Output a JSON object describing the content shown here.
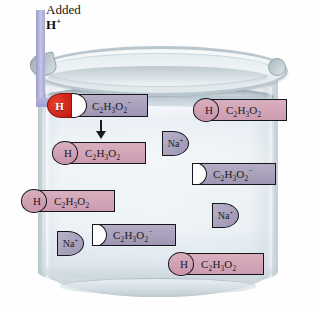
{
  "figure": {
    "feed_label_line1": "Added",
    "feed_label_line2_element": "H",
    "feed_label_line2_charge": "+",
    "arrow_feed_name": "added-h-arrow",
    "arrow_reaction_name": "reaction-down-arrow"
  },
  "colors": {
    "proton_red": "#c01712",
    "acetate_purple": "#a096b4",
    "acid_pink": "#cc9cb0",
    "sodium_purple": "#9d94b2",
    "feed_arrow_purple": "#9fa0cd",
    "glass_gray": "#b9c6cd",
    "liquid_blue": "#dde7ef",
    "outline_black": "#15161c"
  },
  "species": [
    {
      "id": "reacting-pair",
      "kind": "reacting-pair",
      "proton_label": "H",
      "formula_main": "C",
      "formula_html": "C2H3O2",
      "charge": "−",
      "x": 62,
      "y": 94,
      "width": 86,
      "description": "proton docking into acetate anion"
    },
    {
      "id": "product-acetic-acid",
      "kind": "acid",
      "h_label": "H",
      "formula_html": "C2H3O2",
      "charge": "",
      "x": 62,
      "y": 142,
      "width": 84
    },
    {
      "id": "acid-right-top",
      "kind": "acid",
      "h_label": "H",
      "formula_html": "C2H3O2",
      "charge": "",
      "x": 203,
      "y": 99,
      "width": 84
    },
    {
      "id": "acetate-right-mid",
      "kind": "acetate",
      "formula_html": "C2H3O2",
      "charge": "−",
      "x": 192,
      "y": 163,
      "width": 84
    },
    {
      "id": "acid-left-mid",
      "kind": "acid",
      "h_label": "H",
      "formula_html": "C2H3O2",
      "charge": "",
      "x": 31,
      "y": 190,
      "width": 84
    },
    {
      "id": "acetate-bottom-mid",
      "kind": "acetate",
      "formula_html": "C2H3O2",
      "charge": "−",
      "x": 92,
      "y": 224,
      "width": 84
    },
    {
      "id": "acid-bottom-right",
      "kind": "acid",
      "h_label": "H",
      "formula_html": "C2H3O2",
      "charge": "",
      "x": 178,
      "y": 253,
      "width": 86
    }
  ],
  "sodium_ions": [
    {
      "id": "na-top",
      "label": "Na",
      "charge": "+",
      "x": 162,
      "y": 131
    },
    {
      "id": "na-right",
      "label": "Na",
      "charge": "+",
      "x": 212,
      "y": 203
    },
    {
      "id": "na-bottom",
      "label": "Na",
      "charge": "+",
      "x": 57,
      "y": 231
    }
  ]
}
